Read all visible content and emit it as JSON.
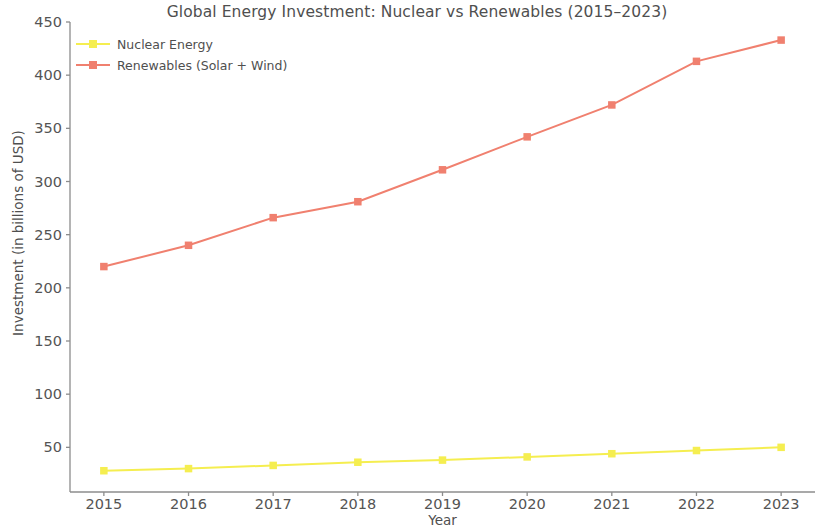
{
  "chart_data": {
    "type": "line",
    "title": "Global Energy Investment: Nuclear vs Renewables (2015–2023)",
    "xlabel": "Year",
    "ylabel": "Investment (in billions of USD)",
    "categories": [
      2015,
      2016,
      2017,
      2018,
      2019,
      2020,
      2021,
      2022,
      2023
    ],
    "xtick_labels": [
      "2015",
      "2016",
      "2017",
      "2018",
      "2019",
      "2020",
      "2021",
      "2022",
      "2023"
    ],
    "ytick_labels": [
      "50",
      "100",
      "150",
      "200",
      "250",
      "300",
      "350",
      "400",
      "450"
    ],
    "yticks": [
      50,
      100,
      150,
      200,
      250,
      300,
      350,
      400,
      450
    ],
    "ylim": [
      8,
      450
    ],
    "xlim": [
      2014.6,
      2023.4
    ],
    "grid": false,
    "legend_position": "upper left",
    "series": [
      {
        "name": "Nuclear Energy",
        "color": "#F5EE50",
        "marker": "square",
        "values": [
          28,
          30,
          33,
          36,
          38,
          41,
          44,
          47,
          50
        ]
      },
      {
        "name": "Renewables (Solar + Wind)",
        "color": "#F0806F",
        "marker": "square",
        "values": [
          220,
          240,
          266,
          281,
          311,
          342,
          372,
          413,
          433
        ]
      }
    ]
  },
  "axis_color": "#8c8c8c",
  "background_color": "#ffffff"
}
